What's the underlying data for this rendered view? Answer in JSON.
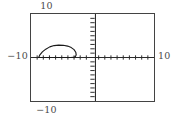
{
  "graph": {
    "labels": {
      "top": "10",
      "bottom": "−10",
      "left": "−10",
      "right": "10"
    },
    "colors": {
      "frame": "#434343",
      "axis": "#2b2b2b",
      "curve": "#1a1a1a",
      "background": "#ffffff",
      "label_text": "#4a4a4a"
    }
  },
  "chart_data": {
    "type": "line",
    "title": "",
    "xlabel": "",
    "ylabel": "",
    "xlim": [
      -10,
      10
    ],
    "ylim": [
      -10,
      10
    ],
    "grid": false,
    "legend": "none",
    "x_tick_interval": 1,
    "y_tick_interval": 1,
    "x_tick_values": [
      -10,
      -9,
      -8,
      -7,
      -6,
      -5,
      -4,
      -3,
      -2,
      -1,
      0,
      1,
      2,
      3,
      4,
      5,
      6,
      7,
      8,
      9,
      10
    ],
    "y_tick_values": [
      -10,
      -9,
      -8,
      -7,
      -6,
      -5,
      -4,
      -3,
      -2,
      -1,
      0,
      1,
      2,
      3,
      4,
      5,
      6,
      7,
      8,
      9,
      10
    ],
    "axis_tick_labels_shown": false,
    "corner_labels": {
      "top": "10",
      "bottom": "-10",
      "left": "-10",
      "right": "10"
    },
    "series": [
      {
        "name": "closed-loop-curve",
        "closed": true,
        "x": [
          -8.75,
          -8.55,
          -8.15,
          -7.6,
          -6.95,
          -6.25,
          -5.5,
          -4.75,
          -4.05,
          -3.45,
          -3.0,
          -2.72,
          -2.65,
          -2.78,
          -3.1,
          -3.55,
          -4.1,
          -4.75,
          -5.45,
          -6.15,
          -6.85,
          -7.5,
          -8.05,
          -8.45,
          -8.7,
          -8.78,
          -8.75
        ],
        "y": [
          0.0,
          0.62,
          1.28,
          1.92,
          2.44,
          2.74,
          2.84,
          2.8,
          2.62,
          2.28,
          1.8,
          1.22,
          0.62,
          0.2,
          0.02,
          0.0,
          0.0,
          0.0,
          0.0,
          0.0,
          0.0,
          0.0,
          0.0,
          0.0,
          0.0,
          0.0,
          0.0
        ]
      }
    ]
  }
}
